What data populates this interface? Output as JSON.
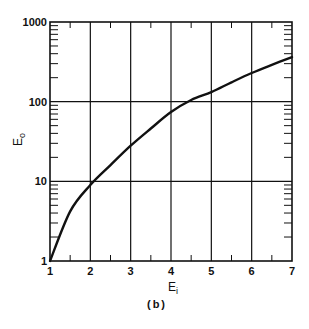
{
  "chart_data": {
    "type": "line",
    "title": "",
    "caption": "(b)",
    "xlabel": "E",
    "xlabel_sub": "i",
    "ylabel": "E",
    "ylabel_sub": "o",
    "xlim": [
      1,
      7
    ],
    "ylim": [
      1,
      1000
    ],
    "yscale": "log",
    "grid": true,
    "x_ticks": [
      "1",
      "2",
      "3",
      "4",
      "5",
      "6",
      "7"
    ],
    "y_ticks": [
      "1",
      "10",
      "100",
      "1000"
    ],
    "series": [
      {
        "name": "E_o vs E_i",
        "x": [
          1,
          1.5,
          2,
          2.5,
          3,
          3.5,
          4,
          4.5,
          5,
          5.5,
          6,
          6.5,
          7
        ],
        "y": [
          1,
          4.2,
          9,
          16,
          28,
          46,
          74,
          105,
          132,
          175,
          229,
          290,
          363
        ]
      }
    ]
  }
}
